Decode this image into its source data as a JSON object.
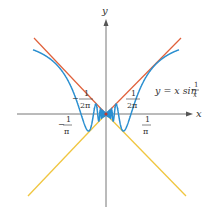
{
  "figure": {
    "axes": {
      "x_label": "x",
      "y_label": "y",
      "origin_px": [
        106,
        114
      ],
      "scale_px_per_unit": 78.5
    },
    "curve_label": {
      "prefix": "y = x sin ",
      "frac_num": "1",
      "frac_den": "x"
    },
    "tick_labels": {
      "left_upper": {
        "sign": "−",
        "num": "1",
        "den": "2π"
      },
      "right_upper": {
        "sign": "",
        "num": "1",
        "den": "2π"
      },
      "left_lower": {
        "sign": "−",
        "num": "1",
        "den": "π"
      },
      "right_lower": {
        "sign": "",
        "num": "1",
        "den": "π"
      }
    },
    "colors": {
      "curve": "#2a8fd0",
      "upper_bound": "#e0603a",
      "lower_bound": "#f0c640",
      "axis": "#666666",
      "text": "#333333"
    },
    "functions": [
      {
        "name": "curve",
        "expr": "y = x sin(1/x)"
      },
      {
        "name": "upper_bound",
        "expr": "y = |x|"
      },
      {
        "name": "lower_bound",
        "expr": "y = -|x|"
      }
    ]
  }
}
